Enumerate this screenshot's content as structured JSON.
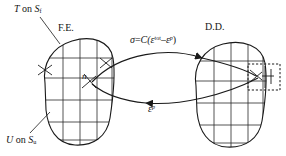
{
  "figure": {
    "name": "fe-dd-coupling-diagram",
    "line_color": "#1a1a1a",
    "background_color": "#ffffff"
  },
  "domains": {
    "left": {
      "label": "F.E.",
      "boundary_labels": {
        "traction": {
          "symbol": "T",
          "text": "on",
          "surface": "S",
          "surface_sub": "f"
        },
        "displacement": {
          "symbol": "U",
          "text": "on",
          "surface": "S",
          "surface_sub": "u"
        }
      },
      "node_label": "n"
    },
    "right": {
      "label": "D.D.",
      "detail_box": "dashed-inset"
    }
  },
  "arrows": {
    "top": {
      "direction": "right",
      "label": {
        "lhs": "σ",
        "eq": "=",
        "coef": "C(",
        "strain1": "ε",
        "strain1_sup": "tot",
        "minus": "–",
        "strain2": "ε",
        "strain2_sup": "p",
        "close": ")"
      }
    },
    "bottom": {
      "direction": "left",
      "label": {
        "strain": "ε",
        "strain_sup": "p"
      }
    }
  }
}
